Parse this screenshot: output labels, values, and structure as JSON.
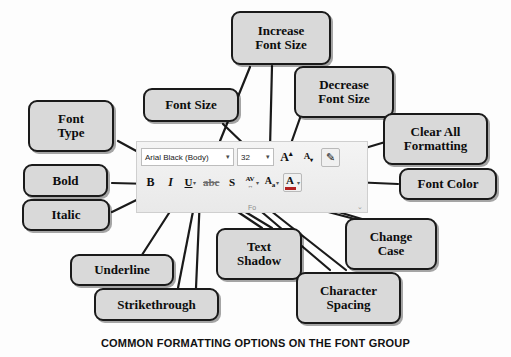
{
  "caption": "COMMON FORMATTING OPTIONS ON THE FONT GROUP",
  "ribbon": {
    "group_label": "Fo",
    "dialog_launcher": "⌄",
    "font_name": {
      "value": "Arial Black (Body)",
      "caret": "▾"
    },
    "font_size": {
      "value": "32",
      "caret": "▾"
    },
    "buttons": [
      {
        "name": "increase-font-size",
        "glyph": "A",
        "sup": "▴"
      },
      {
        "name": "decrease-font-size",
        "glyph": "A",
        "sub": "▾"
      },
      {
        "name": "clear-all-formatting",
        "glyph": "✧"
      },
      {
        "name": "bold",
        "glyph": "B"
      },
      {
        "name": "italic",
        "glyph": "I"
      },
      {
        "name": "underline",
        "glyph": "U",
        "caret": "▾"
      },
      {
        "name": "strikethrough",
        "glyph": "abc"
      },
      {
        "name": "text-shadow",
        "glyph": "S"
      },
      {
        "name": "character-spacing",
        "glyph": "AV",
        "arrows": "↔",
        "caret": "▾"
      },
      {
        "name": "change-case",
        "glyph": "A",
        "sub": "a",
        "caret": "▾"
      },
      {
        "name": "font-color",
        "glyph": "A",
        "caret": "▾",
        "color": "#b32020"
      }
    ]
  },
  "callouts": [
    {
      "id": "increase-font-size",
      "label": "Increase\nFont Size"
    },
    {
      "id": "decrease-font-size",
      "label": "Decrease\nFont Size"
    },
    {
      "id": "font-size",
      "label": "Font Size"
    },
    {
      "id": "font-type",
      "label": "Font\nType"
    },
    {
      "id": "clear-all-formatting",
      "label": "Clear All\nFormatting"
    },
    {
      "id": "font-color",
      "label": "Font Color"
    },
    {
      "id": "bold",
      "label": "Bold"
    },
    {
      "id": "italic",
      "label": "Italic"
    },
    {
      "id": "underline",
      "label": "Underline"
    },
    {
      "id": "strikethrough",
      "label": "Strikethrough"
    },
    {
      "id": "text-shadow",
      "label": "Text\nShadow"
    },
    {
      "id": "change-case",
      "label": "Change\nCase"
    },
    {
      "id": "character-spacing",
      "label": "Character\nSpacing"
    }
  ],
  "colors": {
    "callout_fill": "#d9d9d9",
    "callout_border": "#1a1a1a",
    "font_color_swatch": "#b32020",
    "ribbon_bg": "#eeeeee"
  }
}
